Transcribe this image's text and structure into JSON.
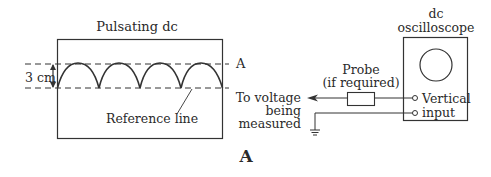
{
  "figure": {
    "caption": "A",
    "colors": {
      "stroke": "#333333",
      "text": "#2a2a2a",
      "background": "#ffffff"
    }
  },
  "waveform_panel": {
    "title": "Pulsating dc",
    "level_label": "A",
    "height_label": "3 cm",
    "reference_label": "Reference line",
    "humps": 4
  },
  "circuit": {
    "source_label_line1": "To voltage",
    "source_label_line2": "being",
    "source_label_line3": "measured",
    "probe_label_line1": "Probe",
    "probe_label_line2": "(if required)",
    "scope_title_line1": "dc",
    "scope_title_line2": "oscilloscope",
    "input_label_line1": "Vertical",
    "input_label_line2": "input"
  }
}
